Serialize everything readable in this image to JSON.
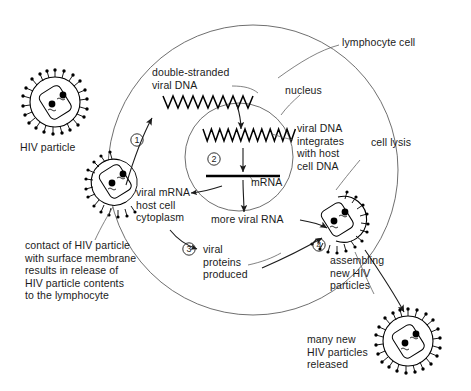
{
  "diagram": {
    "background_color": "#ffffff",
    "ink_color": "#1b1b1b",
    "line_color": "#4a4a4a"
  },
  "labels": {
    "hiv_particle": "HIV particle",
    "double_stranded_viral_dna": "double-stranded\nviral DNA",
    "lymphocyte_cell": "lymphocyte cell",
    "nucleus": "nucleus",
    "viral_dna_integrates": "viral DNA\nintegrates\nwith host\ncell DNA",
    "cell_lysis": "cell lysis",
    "mrna": "mRNA",
    "viral_mrna_cytoplasm": "viral mRNA\nhost cell\ncytoplasm",
    "more_viral_rna": "more viral RNA",
    "contact_of_hiv": "contact of HIV particle\nwith surface membrane\nresults in release of\nHIV particle contents\nto the lymphocyte",
    "viral_proteins_produced": "viral\nproteins\nproduced",
    "assembling_new_hiv": "assembling\nnew HIV\nparticles",
    "many_new_released": "many new\nHIV particles\nreleased"
  },
  "steps": [
    {
      "id": "1",
      "glyph": "①",
      "number": "1",
      "meaning": "reverse transcription to double-stranded viral DNA"
    },
    {
      "id": "2",
      "glyph": "②",
      "number": "2",
      "meaning": "transcription of integrated DNA to mRNA"
    },
    {
      "id": "3",
      "glyph": "③",
      "number": "3",
      "meaning": "translation into viral proteins"
    },
    {
      "id": "4",
      "glyph": "④",
      "number": "4",
      "meaning": "assembly and budding of new particles"
    }
  ],
  "particles": [
    {
      "name": "free-hiv-particle",
      "state": "free",
      "spikes": 22,
      "label": "HIV particle"
    },
    {
      "name": "fusing-hiv-particle",
      "state": "fusing-with-membrane",
      "spikes": 14,
      "label": ""
    },
    {
      "name": "budding-hiv-particle",
      "state": "assembling-budding",
      "spikes": 18,
      "label": "assembling new HIV particles"
    },
    {
      "name": "released-hiv-particle",
      "state": "released",
      "spikes": 22,
      "label": "many new HIV particles released"
    }
  ]
}
